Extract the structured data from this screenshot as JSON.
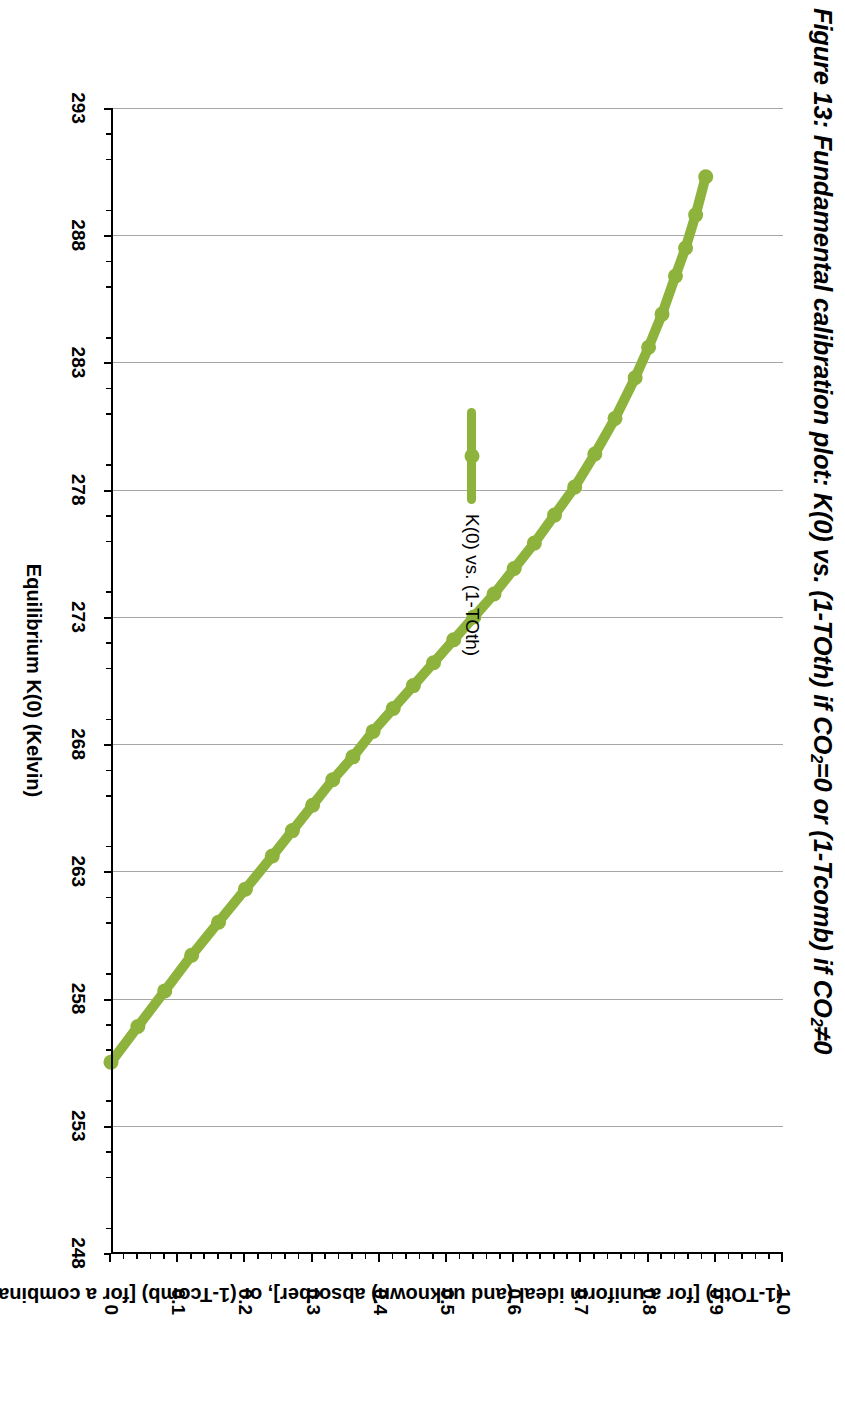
{
  "figure": {
    "title_prefix": "Figure 13: Fundamental calibration plot: K(0) vs. (1-TOth) if CO",
    "title_sub1": "2",
    "title_mid": "=0 or (1-Tcomb) if CO",
    "title_sub2": "2",
    "title_suffix": "≠0"
  },
  "legend": {
    "position": "inside-top-left",
    "entries": [
      {
        "label": "K(0) vs. (1-TOth)",
        "color": "#8DB33C",
        "marker": "circle"
      }
    ]
  },
  "colors": {
    "series": "#8DB33C",
    "gridline": "#A6A6A6",
    "axis": "#000000",
    "background": "#FFFFFF"
  },
  "chart_data": {
    "type": "line",
    "title": "Figure 13: Fundamental calibration plot: K(0) vs. (1-TOth) if CO2=0 or (1-Tcomb) if CO2≠0",
    "xlabel": "(1-TOth) [for a uniform ideal (and unknown) absorber], or (1-Tcomb) [for a combination of absorbers]",
    "ylabel": "Equilibrium K(0) (Kelvin)",
    "xlim": [
      0,
      1.0
    ],
    "ylim": [
      248,
      293
    ],
    "x_ticks": [
      "0",
      "0.1",
      "0.2",
      "0.3",
      "0.4",
      "0.5",
      "0.6",
      "0.7",
      "0.8",
      "0.9",
      "1.0"
    ],
    "x_tick_values": [
      0,
      0.1,
      0.2,
      0.3,
      0.4,
      0.5,
      0.6,
      0.7,
      0.8,
      0.9,
      1.0
    ],
    "x_minor_interval": 0.02,
    "y_ticks": [
      "248",
      "253",
      "258",
      "263",
      "268",
      "273",
      "278",
      "283",
      "288",
      "293"
    ],
    "y_tick_values": [
      248,
      253,
      258,
      263,
      268,
      273,
      278,
      283,
      288,
      293
    ],
    "y_minor_interval": 1,
    "grid": "y-major-only",
    "legend_position": "inside-upper-left",
    "series": [
      {
        "name": "K(0) vs. (1-TOth)",
        "color": "#8DB33C",
        "marker": "circle",
        "x": [
          0.0,
          0.04,
          0.08,
          0.12,
          0.16,
          0.2,
          0.24,
          0.27,
          0.3,
          0.33,
          0.36,
          0.39,
          0.42,
          0.45,
          0.48,
          0.51,
          0.54,
          0.57,
          0.6,
          0.63,
          0.66,
          0.69,
          0.72,
          0.75,
          0.78,
          0.8,
          0.82,
          0.84,
          0.855,
          0.87,
          0.885
        ],
        "y": [
          255.5,
          256.9,
          258.3,
          259.7,
          261.0,
          262.3,
          263.6,
          264.6,
          265.6,
          266.6,
          267.5,
          268.5,
          269.4,
          270.3,
          271.2,
          272.1,
          273.0,
          273.9,
          274.9,
          275.9,
          277.0,
          278.1,
          279.4,
          280.8,
          282.4,
          283.6,
          284.9,
          286.4,
          287.5,
          288.8,
          290.3
        ]
      }
    ]
  }
}
